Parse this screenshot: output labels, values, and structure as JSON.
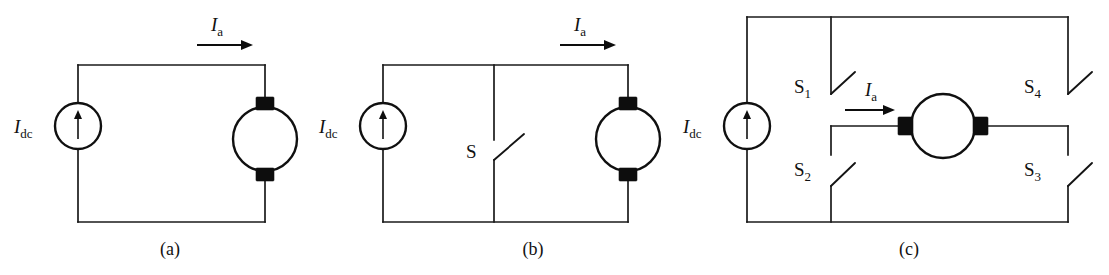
{
  "figure": {
    "background_color": "#ffffff",
    "line_color": "#1a1a1a",
    "fill_color": "#0d0d0d",
    "width": 1109,
    "height": 275
  },
  "labels": {
    "current_symbol": "I",
    "dc_subscript": "dc",
    "armature_subscript": "a",
    "switch_single": "S",
    "switch_1": "S",
    "switch_1_sub": "1",
    "switch_2": "S",
    "switch_2_sub": "2",
    "switch_3": "S",
    "switch_3_sub": "3",
    "switch_4": "S",
    "switch_4_sub": "4"
  },
  "panels": [
    {
      "id": "a",
      "caption": "(a)",
      "description": "DC current source feeding a DC motor directly",
      "source_label": "I",
      "source_sub": "dc",
      "current_label": "I",
      "current_sub": "a",
      "components": [
        "current-source",
        "dc-motor"
      ],
      "switch_count": 0
    },
    {
      "id": "b",
      "caption": "(b)",
      "description": "DC current source with series bypass switch S feeding a DC motor",
      "source_label": "I",
      "source_sub": "dc",
      "current_label": "I",
      "current_sub": "a",
      "components": [
        "current-source",
        "switch",
        "dc-motor"
      ],
      "switch_labels": [
        "S"
      ],
      "switch_count": 1
    },
    {
      "id": "c",
      "caption": "(c)",
      "description": "DC current source with four-switch H-bridge feeding a DC motor",
      "source_label": "I",
      "source_sub": "dc",
      "current_label": "I",
      "current_sub": "a",
      "components": [
        "current-source",
        "switch",
        "switch",
        "switch",
        "switch",
        "dc-motor"
      ],
      "switch_labels": [
        "S1",
        "S2",
        "S3",
        "S4"
      ],
      "switch_count": 4
    }
  ],
  "captions": {
    "a": "(a)",
    "b": "(b)",
    "c": "(c)"
  }
}
